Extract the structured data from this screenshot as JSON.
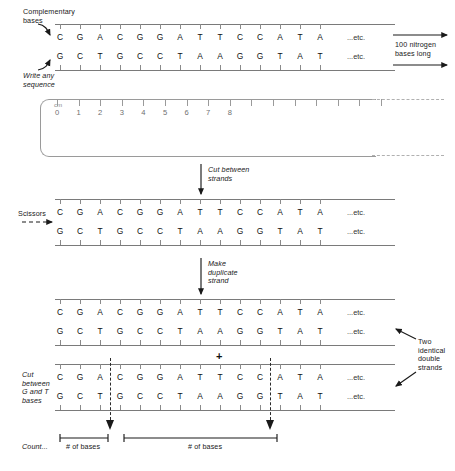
{
  "figure": {
    "etc_label": "...etc.",
    "plus_symbol": "+"
  },
  "sequences": {
    "top_strand": [
      "C",
      "G",
      "A",
      "C",
      "G",
      "G",
      "A",
      "T",
      "T",
      "C",
      "C",
      "A",
      "T",
      "A"
    ],
    "bottom_strand": [
      "G",
      "C",
      "T",
      "G",
      "C",
      "C",
      "T",
      "A",
      "A",
      "G",
      "G",
      "T",
      "A",
      "T"
    ]
  },
  "annotations": {
    "complementary_bases": "Complementary\nbases",
    "write_any_sequence": "Write any\nsequence",
    "length_note": "100 nitrogen\nbases long",
    "cut_between_strands": "Cut between\nstrands",
    "scissors": "Scissors",
    "make_duplicate_strand": "Make\nduplicate\nstrand",
    "two_identical_double_strands": "Two\nidentical\ndouble\nstrands",
    "cut_between_g_and_t": "Cut\nbetween\nG and T\nbases",
    "count": "Count...",
    "number_of_bases_left": "# of bases",
    "number_of_bases_right": "# of bases"
  },
  "ruler": {
    "unit_label": "cm",
    "numbers": [
      "0",
      "1",
      "2",
      "3",
      "4",
      "5",
      "6",
      "7",
      "8"
    ]
  },
  "cut_positions": {
    "first_cut_after_base_index": 3,
    "second_cut_after_base_index": 11
  },
  "colors": {
    "ink": "#1a1a1a",
    "rail": "#7a7a7a",
    "ruler": "#9a9a9a",
    "background": "#ffffff"
  }
}
